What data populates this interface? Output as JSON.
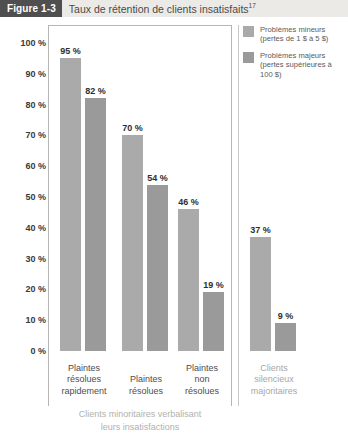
{
  "figure": {
    "badge": "Figure 1-3",
    "title": "Taux de rétention de clients insatisfaits",
    "footnote_marker": "17"
  },
  "legend": {
    "position": "top-right",
    "items": [
      {
        "swatch_color": "#aaaaaa",
        "line1": "Problèmes mineurs",
        "line2": "(pertes de 1 $ à 5 $)"
      },
      {
        "swatch_color": "#9a9a9a",
        "line1": "Problèmes majeurs",
        "line2": "(pertes supérieures à 100 $)"
      }
    ]
  },
  "axis": {
    "y_ticks": [
      "100 %",
      "90 %",
      "80 %",
      "70 %",
      "60 %",
      "50 %",
      "40 %",
      "30 %",
      "20 %",
      "10 %",
      "0 %"
    ]
  },
  "categories_detail": [
    {
      "lines": [
        "Plaintes",
        "résolues",
        "rapidement"
      ],
      "muted": false
    },
    {
      "lines": [
        "Plaintes",
        "résolues",
        ""
      ],
      "muted": false
    },
    {
      "lines": [
        "Plaintes",
        "non",
        "résolues"
      ],
      "muted": false
    },
    {
      "lines": [
        "Clients",
        "silencieux",
        "majoritaires"
      ],
      "muted": true
    }
  ],
  "bar_labels": {
    "g0": [
      "95 %",
      "82 %"
    ],
    "g1": [
      "70 %",
      "54 %"
    ],
    "g2": [
      "46 %",
      "19 %"
    ],
    "g3": [
      "37 %",
      "9 %"
    ]
  },
  "bottom_caption": {
    "line1": "Clients minoritaires verbalisant",
    "line2": "leurs insatisfactions"
  },
  "chart_data": {
    "type": "bar",
    "title": "Taux de rétention de clients insatisfaits",
    "subtitle": "",
    "xlabel": "",
    "ylabel": "",
    "ylim": [
      0,
      100
    ],
    "yunit": "%",
    "ytick_values": [
      0,
      10,
      20,
      30,
      40,
      50,
      60,
      70,
      80,
      90,
      100
    ],
    "ytick_labels": [
      "0 %",
      "10 %",
      "20 %",
      "30 %",
      "40 %",
      "50 %",
      "60 %",
      "70 %",
      "80 %",
      "90 %",
      "100 %"
    ],
    "grid": false,
    "legend_position": "top-right",
    "categories": [
      "Plaintes résolues rapidement",
      "Plaintes résolues",
      "Plaintes non résolues",
      "Clients silencieux majoritaires"
    ],
    "series": [
      {
        "name": "Problèmes mineurs (pertes de 1 $ à 5 $)",
        "color": "#aaaaaa",
        "values": [
          95,
          70,
          46,
          37
        ]
      },
      {
        "name": "Problèmes majeurs (pertes supérieures à 100 $)",
        "color": "#9a9a9a",
        "values": [
          82,
          54,
          19,
          9
        ]
      }
    ],
    "data_labels": [
      [
        "95 %",
        "70 %",
        "46 %",
        "37 %"
      ],
      [
        "82 %",
        "54 %",
        "19 %",
        "9 %"
      ]
    ],
    "annotations": [
      "Clients minoritaires verbalisant leurs insatisfactions"
    ]
  }
}
